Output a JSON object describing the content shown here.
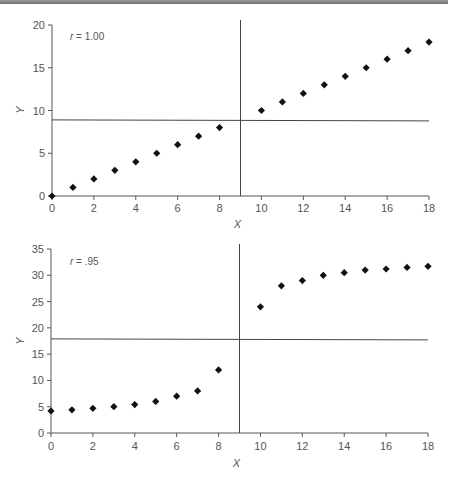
{
  "chart_data": [
    {
      "type": "scatter",
      "title": "",
      "annotation": "r = 1.00",
      "annotation_var": "r",
      "annotation_value": "= 1.00",
      "xlabel": "X",
      "ylabel": "Y",
      "xlim": [
        0,
        18
      ],
      "ylim": [
        0,
        20
      ],
      "xticks": [
        0,
        2,
        4,
        6,
        8,
        10,
        12,
        14,
        16,
        18
      ],
      "yticks": [
        0,
        5,
        10,
        15,
        20
      ],
      "grid": false,
      "reference_lines": {
        "vertical_x": 9,
        "horizontal_y": 8.9
      },
      "x": [
        0,
        1,
        2,
        3,
        4,
        5,
        6,
        7,
        8,
        10,
        11,
        12,
        13,
        14,
        15,
        16,
        17,
        18
      ],
      "y": [
        0,
        1,
        2,
        3,
        4,
        5,
        6,
        7,
        8,
        10,
        11,
        12,
        13,
        14,
        15,
        16,
        17,
        18
      ],
      "marker": "diamond"
    },
    {
      "type": "scatter",
      "title": "",
      "annotation": "r = .95",
      "annotation_var": "r",
      "annotation_value": "= .95",
      "xlabel": "X",
      "ylabel": "Y",
      "xlim": [
        0,
        18
      ],
      "ylim": [
        0,
        35
      ],
      "xticks": [
        0,
        2,
        4,
        6,
        8,
        10,
        12,
        14,
        16,
        18
      ],
      "yticks": [
        0,
        5,
        10,
        15,
        20,
        25,
        30,
        35
      ],
      "grid": false,
      "reference_lines": {
        "vertical_x": 9,
        "horizontal_y": 17.9
      },
      "x": [
        0,
        1,
        2,
        3,
        4,
        5,
        6,
        7,
        8,
        10,
        11,
        12,
        13,
        14,
        15,
        16,
        17,
        18
      ],
      "y": [
        4.2,
        4.4,
        4.7,
        5.0,
        5.4,
        6.0,
        7.0,
        8.0,
        12.0,
        24.0,
        28.0,
        29.0,
        30.0,
        30.5,
        31.0,
        31.2,
        31.5,
        31.7
      ],
      "marker": "diamond"
    }
  ],
  "colors": {
    "marker": "#111111",
    "axis": "#555555",
    "reference_line": "#444444",
    "top_bar": "#7a7a7a"
  }
}
